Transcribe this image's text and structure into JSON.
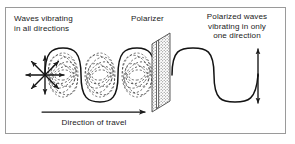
{
  "figure": {
    "title_alt": "Polarization of light by a polarizer",
    "border_color": "#9a9a9a",
    "ink_color": "#1b1b1b",
    "background": "#ffffff"
  },
  "labels": {
    "unpolarized": "Waves vibrating\nin all directions",
    "polarizer": "Polarizer",
    "polarized": "Polarized waves\nvibrating in only\none direction",
    "direction_of_travel": "Direction of travel"
  },
  "elements": {
    "vibration_burst": {
      "name": "radial vibration arrows",
      "ray_count": 8,
      "center_x": 45,
      "center_y": 75,
      "ray_length": 19,
      "angles_deg": [
        0,
        45,
        90,
        135,
        180,
        225,
        270,
        315
      ]
    },
    "unpolarized_wave": {
      "name": "sinusoidal wave with all-direction vibration planes",
      "start_x": 45,
      "end_x": 155,
      "axis_y": 75,
      "amplitude": 27,
      "cycles": 3,
      "dashed_plane_count": 7,
      "line_style": "solid outline with dashed ellipses"
    },
    "polarizer": {
      "name": "polarizing filter panel",
      "fill": "stippled",
      "slit_orientation": "vertical",
      "left_x": 152,
      "right_x": 172,
      "top_y": 33,
      "bottom_y": 112
    },
    "polarized_wave": {
      "name": "plane polarized sine wave",
      "start_x": 172,
      "end_x": 258,
      "axis_y": 75,
      "amplitude": 27,
      "cycles": 2
    },
    "polarization_arrow": {
      "name": "vertical double headed arrow",
      "x": 258,
      "top_y": 48,
      "bottom_y": 104,
      "heads": "both"
    },
    "travel_arrow": {
      "name": "direction of travel arrow",
      "x1": 42,
      "x2": 146,
      "y": 112,
      "heads": "right"
    }
  }
}
